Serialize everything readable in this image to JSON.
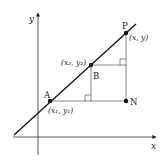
{
  "diagram": {
    "type": "coordinate-geometry",
    "axes": {
      "x_label": "x",
      "y_label": "y"
    },
    "points": {
      "A": {
        "name": "A",
        "coords": "(x₁, y₁)"
      },
      "B": {
        "name": "B",
        "coords": "(x₂, y₂)"
      },
      "P": {
        "name": "P",
        "coords": "(x, y)"
      },
      "N": {
        "name": "N"
      }
    },
    "colors": {
      "stroke": "#222222",
      "thin": "#555555",
      "background": "#ffffff"
    }
  }
}
